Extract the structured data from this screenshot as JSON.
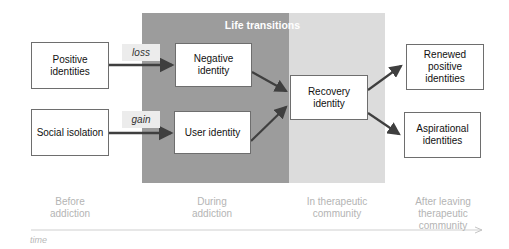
{
  "diagram": {
    "region_title": "Life transitions",
    "nodes": {
      "positive_identities": "Positive identities",
      "social_isolation": "Social isolation",
      "negative_identity": "Negative identity",
      "user_identity": "User identity",
      "recovery_identity": "Recovery identity",
      "renewed_positive_identities": "Renewed positive identities",
      "aspirational_identities": "Aspirational identities"
    },
    "edge_labels": {
      "loss": "loss",
      "gain": "gain"
    },
    "phases": {
      "before": "Before\naddiction",
      "during": "During\naddiction",
      "in_tc": "In therapeutic\ncommunity",
      "after": "After leaving\ntherapeutic\ncommunity"
    },
    "axis_label": "time",
    "colors": {
      "dark_region": "#9c9c9c",
      "light_region": "#dcdcdc",
      "arrow": "#3f3f3f",
      "phase_text": "#b4b4b4"
    }
  }
}
